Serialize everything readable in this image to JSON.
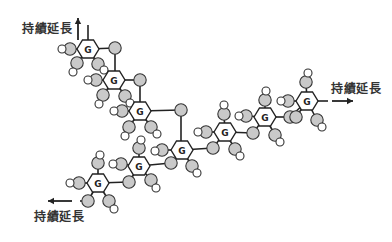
{
  "diagram": {
    "labels": [
      {
        "id": "top-left",
        "text": "持績延長",
        "x": 22,
        "y": 20
      },
      {
        "id": "right",
        "text": "持績延長",
        "x": 331,
        "y": 80
      },
      {
        "id": "bottom-left",
        "text": "持績延長",
        "x": 34,
        "y": 208
      }
    ],
    "arrows": [
      {
        "id": "up",
        "x1": 78,
        "y1": 40,
        "x2": 78,
        "y2": 18
      },
      {
        "id": "right",
        "x1": 332,
        "y1": 101,
        "x2": 353,
        "y2": 101
      },
      {
        "id": "left",
        "x1": 72,
        "y1": 201,
        "x2": 48,
        "y2": 201
      }
    ],
    "hex_label": "G",
    "colors": {
      "gray": "#c9c9c9",
      "stroke": "#222222",
      "white": "#ffffff"
    },
    "hexagons": [
      {
        "id": 1,
        "x": 88,
        "y": 49
      },
      {
        "id": 2,
        "x": 114,
        "y": 80
      },
      {
        "id": 3,
        "x": 140,
        "y": 111
      },
      {
        "id": 4,
        "x": 182,
        "y": 150
      },
      {
        "id": 5,
        "x": 225,
        "y": 132
      },
      {
        "id": 6,
        "x": 265,
        "y": 117
      },
      {
        "id": 7,
        "x": 307,
        "y": 101
      },
      {
        "id": 8,
        "x": 139,
        "y": 166
      },
      {
        "id": 9,
        "x": 98,
        "y": 183
      }
    ],
    "bonds": [
      [
        88,
        49,
        88,
        25
      ],
      [
        88,
        49,
        115,
        48
      ],
      [
        115,
        48,
        115,
        80
      ],
      [
        114,
        80,
        140,
        80
      ],
      [
        140,
        80,
        140,
        111
      ],
      [
        140,
        111,
        181,
        110
      ],
      [
        181,
        110,
        181,
        150
      ],
      [
        182,
        150,
        213,
        148
      ],
      [
        213,
        148,
        225,
        132
      ],
      [
        225,
        132,
        253,
        133
      ],
      [
        253,
        133,
        265,
        117
      ],
      [
        265,
        117,
        290,
        117
      ],
      [
        290,
        117,
        307,
        101
      ],
      [
        307,
        101,
        328,
        101
      ],
      [
        182,
        150,
        171,
        163
      ],
      [
        171,
        163,
        139,
        166
      ],
      [
        139,
        166,
        129,
        182
      ],
      [
        129,
        182,
        98,
        183
      ],
      [
        98,
        183,
        88,
        201
      ],
      [
        88,
        201,
        80,
        201
      ],
      [
        88,
        49,
        70,
        49
      ],
      [
        88,
        49,
        77,
        63
      ],
      [
        88,
        49,
        98,
        64
      ],
      [
        114,
        80,
        96,
        80
      ],
      [
        114,
        80,
        103,
        95
      ],
      [
        114,
        80,
        125,
        96
      ],
      [
        140,
        111,
        122,
        111
      ],
      [
        140,
        111,
        129,
        127
      ],
      [
        140,
        111,
        151,
        127
      ],
      [
        182,
        150,
        162,
        150
      ],
      [
        182,
        150,
        192,
        166
      ],
      [
        225,
        132,
        224,
        114
      ],
      [
        225,
        132,
        206,
        132
      ],
      [
        225,
        132,
        235,
        149
      ],
      [
        265,
        117,
        265,
        100
      ],
      [
        265,
        117,
        246,
        116
      ],
      [
        265,
        117,
        275,
        135
      ],
      [
        307,
        101,
        306,
        82
      ],
      [
        307,
        101,
        288,
        101
      ],
      [
        307,
        101,
        296,
        117
      ],
      [
        307,
        101,
        317,
        120
      ],
      [
        139,
        166,
        139,
        148
      ],
      [
        139,
        166,
        121,
        164
      ],
      [
        139,
        166,
        151,
        180
      ],
      [
        98,
        183,
        98,
        163
      ],
      [
        98,
        183,
        79,
        183
      ],
      [
        98,
        183,
        109,
        201
      ]
    ],
    "gray_circles": [
      [
        70,
        49
      ],
      [
        115,
        48
      ],
      [
        77,
        63
      ],
      [
        98,
        64
      ],
      [
        96,
        80
      ],
      [
        140,
        80
      ],
      [
        103,
        95
      ],
      [
        125,
        96
      ],
      [
        122,
        111
      ],
      [
        181,
        110
      ],
      [
        129,
        127
      ],
      [
        151,
        127
      ],
      [
        162,
        150
      ],
      [
        213,
        148
      ],
      [
        171,
        163
      ],
      [
        192,
        166
      ],
      [
        224,
        114
      ],
      [
        206,
        132
      ],
      [
        253,
        133
      ],
      [
        235,
        149
      ],
      [
        265,
        100
      ],
      [
        246,
        116
      ],
      [
        290,
        117
      ],
      [
        275,
        135
      ],
      [
        306,
        82
      ],
      [
        288,
        101
      ],
      [
        296,
        117
      ],
      [
        317,
        120
      ],
      [
        139,
        148
      ],
      [
        121,
        164
      ],
      [
        151,
        180
      ],
      [
        98,
        163
      ],
      [
        79,
        183
      ],
      [
        129,
        182
      ],
      [
        88,
        201
      ],
      [
        109,
        201
      ]
    ],
    "white_circles": [
      [
        62,
        49
      ],
      [
        73,
        72
      ],
      [
        104,
        70
      ],
      [
        88,
        80
      ],
      [
        99,
        104
      ],
      [
        130,
        103
      ],
      [
        114,
        111
      ],
      [
        125,
        136
      ],
      [
        157,
        134
      ],
      [
        155,
        151
      ],
      [
        197,
        173
      ],
      [
        224,
        105
      ],
      [
        198,
        132
      ],
      [
        240,
        156
      ],
      [
        266,
        91
      ],
      [
        239,
        116
      ],
      [
        280,
        142
      ],
      [
        308,
        73
      ],
      [
        281,
        101
      ],
      [
        322,
        127
      ],
      [
        141,
        140
      ],
      [
        113,
        164
      ],
      [
        156,
        188
      ],
      [
        100,
        155
      ],
      [
        70,
        183
      ],
      [
        114,
        209
      ]
    ]
  }
}
